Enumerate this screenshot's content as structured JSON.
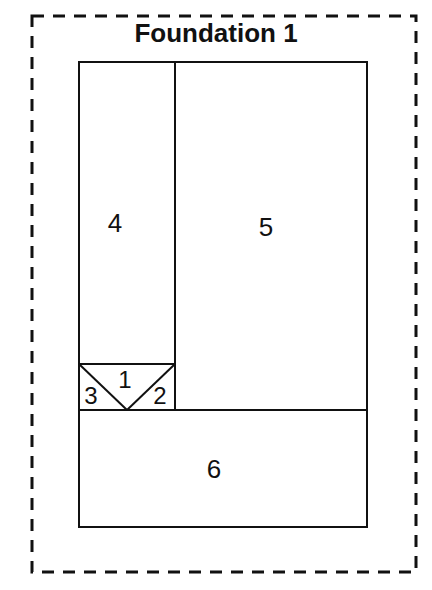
{
  "title": "Foundation 1",
  "pieces": [
    {
      "id": "1",
      "label": "1"
    },
    {
      "id": "2",
      "label": "2"
    },
    {
      "id": "3",
      "label": "3"
    },
    {
      "id": "4",
      "label": "4"
    },
    {
      "id": "5",
      "label": "5"
    },
    {
      "id": "6",
      "label": "6"
    }
  ],
  "colors": {
    "line": "#111111",
    "background": "#ffffff"
  }
}
